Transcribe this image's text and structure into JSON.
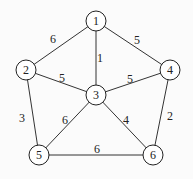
{
  "graph": {
    "nodes": [
      {
        "id": "1",
        "label": "1",
        "x": 96,
        "y": 21
      },
      {
        "id": "2",
        "label": "2",
        "x": 26,
        "y": 70
      },
      {
        "id": "3",
        "label": "3",
        "x": 96,
        "y": 95
      },
      {
        "id": "4",
        "label": "4",
        "x": 170,
        "y": 70
      },
      {
        "id": "5",
        "label": "5",
        "x": 39,
        "y": 155
      },
      {
        "id": "6",
        "label": "6",
        "x": 153,
        "y": 155
      }
    ],
    "edges": [
      {
        "from": "1",
        "to": "2",
        "weight": "6",
        "lx": 53,
        "ly": 40
      },
      {
        "from": "1",
        "to": "3",
        "weight": "1",
        "lx": 100,
        "ly": 59
      },
      {
        "from": "1",
        "to": "4",
        "weight": "5",
        "lx": 137,
        "ly": 41
      },
      {
        "from": "2",
        "to": "3",
        "weight": "5",
        "lx": 62,
        "ly": 79
      },
      {
        "from": "3",
        "to": "4",
        "weight": "5",
        "lx": 130,
        "ly": 80
      },
      {
        "from": "2",
        "to": "5",
        "weight": "3",
        "lx": 22,
        "ly": 119
      },
      {
        "from": "3",
        "to": "5",
        "weight": "6",
        "lx": 65,
        "ly": 121
      },
      {
        "from": "3",
        "to": "6",
        "weight": "4",
        "lx": 126,
        "ly": 121
      },
      {
        "from": "4",
        "to": "6",
        "weight": "2",
        "lx": 170,
        "ly": 117
      },
      {
        "from": "5",
        "to": "6",
        "weight": "6",
        "lx": 97,
        "ly": 150
      }
    ]
  }
}
